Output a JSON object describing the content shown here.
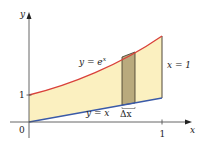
{
  "diagram": {
    "axes": {
      "x_label": "x",
      "y_label": "y",
      "origin_label": "0",
      "x_tick_label": "1",
      "y_tick_label": "1"
    },
    "curves": {
      "upper": {
        "label_main": "y = e",
        "label_exp": "x",
        "color": "#d9413a"
      },
      "lower": {
        "label": "y = x",
        "color": "#3a5aa8"
      }
    },
    "boundary": {
      "label": "x = 1"
    },
    "strip": {
      "label": "Δx",
      "color": "#b9aa7d"
    },
    "region_fill": "#fbf0c0"
  }
}
